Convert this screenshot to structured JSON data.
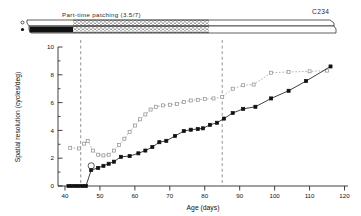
{
  "figure": {
    "top_bar": {
      "patching_label": "Part-time patching (3.5/7)",
      "subject_code": "C234",
      "open_marker_name": "open-circle-marker",
      "filled_marker_name": "filled-circle-marker"
    },
    "axes": {
      "xlabel": "Age (days)",
      "ylabel": "Spatial resolution (cycles/deg)",
      "xticks": [
        40,
        50,
        60,
        70,
        80,
        90,
        100,
        110,
        120
      ],
      "yticks": [
        0,
        2,
        4,
        6,
        8,
        10
      ],
      "xlim": [
        38,
        121
      ],
      "ylim": [
        0,
        10
      ]
    },
    "vlines": [
      44.5,
      85
    ],
    "annotation_open_circle": {
      "x": 47.5,
      "y": 1.45
    }
  },
  "chart_data": {
    "type": "line",
    "title": "",
    "subtitle": "Part-time patching (3.5/7)",
    "xlabel": "Age (days)",
    "ylabel": "Spatial resolution (cycles/deg)",
    "xlim": [
      38,
      121
    ],
    "ylim": [
      0,
      10
    ],
    "xticks": [
      40,
      50,
      60,
      70,
      80,
      90,
      100,
      110,
      120
    ],
    "yticks": [
      0,
      2,
      4,
      6,
      8,
      10
    ],
    "grid": false,
    "legend": "none",
    "annotations": [
      {
        "text": "Part-time patching (3.5/7)",
        "x": 62,
        "y": 10.9
      },
      {
        "text": "C234",
        "x": 114,
        "y": 11.1
      }
    ],
    "vertical_reference_lines": [
      44.5,
      85
    ],
    "series": [
      {
        "name": "Non-deprived (fellow) eye",
        "marker": "open-square",
        "linestyle": "dotted",
        "color": "#8a8a8a",
        "points": [
          [
            41.5,
            2.75
          ],
          [
            44.0,
            2.7
          ],
          [
            45.5,
            3.05
          ],
          [
            46.5,
            3.25
          ],
          [
            48.0,
            2.55
          ],
          [
            49.5,
            2.25
          ],
          [
            51.0,
            2.2
          ],
          [
            52.5,
            2.25
          ],
          [
            54.0,
            2.55
          ],
          [
            55.5,
            2.95
          ],
          [
            57.0,
            3.4
          ],
          [
            58.5,
            3.9
          ],
          [
            60.0,
            4.35
          ],
          [
            61.5,
            4.8
          ],
          [
            63.0,
            5.15
          ],
          [
            64.5,
            5.5
          ],
          [
            66.0,
            5.7
          ],
          [
            68.0,
            5.8
          ],
          [
            70.0,
            5.85
          ],
          [
            72.0,
            5.9
          ],
          [
            74.0,
            6.05
          ],
          [
            76.0,
            6.15
          ],
          [
            78.0,
            6.2
          ],
          [
            80.0,
            6.25
          ],
          [
            82.5,
            6.3
          ],
          [
            85.0,
            6.4
          ],
          [
            88.0,
            7.0
          ],
          [
            91.0,
            7.25
          ],
          [
            94.0,
            7.3
          ],
          [
            99.0,
            8.15
          ],
          [
            104.0,
            8.2
          ],
          [
            110.0,
            8.25
          ],
          [
            115.0,
            8.3
          ]
        ]
      },
      {
        "name": "Deprived eye",
        "marker": "filled-square",
        "linestyle": "solid",
        "color": "#111111",
        "points": [
          [
            41.0,
            0.0
          ],
          [
            42.0,
            0.0
          ],
          [
            43.0,
            0.0
          ],
          [
            44.0,
            0.0
          ],
          [
            45.0,
            0.0
          ],
          [
            46.0,
            0.0
          ],
          [
            47.5,
            1.15
          ],
          [
            49.5,
            1.3
          ],
          [
            51.0,
            1.45
          ],
          [
            52.5,
            1.6
          ],
          [
            54.0,
            1.75
          ],
          [
            56.0,
            2.1
          ],
          [
            58.5,
            2.15
          ],
          [
            61.0,
            2.35
          ],
          [
            63.0,
            2.55
          ],
          [
            65.0,
            2.8
          ],
          [
            67.0,
            3.15
          ],
          [
            69.0,
            3.25
          ],
          [
            71.5,
            3.6
          ],
          [
            74.0,
            3.95
          ],
          [
            76.0,
            4.05
          ],
          [
            78.0,
            4.1
          ],
          [
            79.5,
            4.15
          ],
          [
            81.5,
            4.4
          ],
          [
            83.5,
            4.55
          ],
          [
            85.5,
            4.85
          ],
          [
            88.0,
            5.25
          ],
          [
            91.0,
            5.55
          ],
          [
            94.5,
            5.7
          ],
          [
            99.0,
            6.3
          ],
          [
            104.0,
            6.85
          ],
          [
            109.0,
            7.55
          ],
          [
            116.0,
            8.6
          ]
        ]
      }
    ]
  }
}
